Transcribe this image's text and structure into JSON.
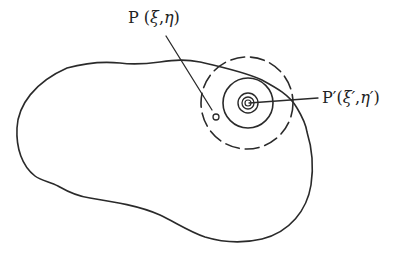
{
  "diagram": {
    "type": "region-with-point-and-concentric-circles",
    "stroke_color": "#2a2a2a",
    "labels": {
      "point_p": {
        "name": "P",
        "open": " (",
        "xi": "ξ",
        "sep": ",",
        "eta": "η",
        "close": ")"
      },
      "point_p_prime": {
        "name": "P′",
        "open": "(",
        "xi": "ξ′",
        "sep": ",",
        "eta": "η′",
        "close": ")"
      }
    },
    "elements": {
      "region_boundary": "closed irregular curve",
      "source_point": "P (ξ,η) small circle inside region",
      "field_point": "P′(ξ′,η′) on boundary with concentric circles",
      "dashed_circle": "outer dashed circle around P′",
      "solid_circles": 4
    }
  }
}
